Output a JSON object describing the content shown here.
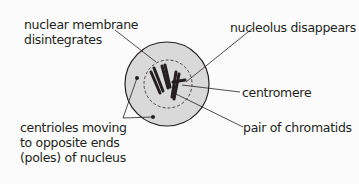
{
  "diagram": {
    "labels": {
      "nuclear_membrane_line1": "nuclear membrane",
      "nuclear_membrane_line2": "disintegrates",
      "nucleolus": "nucleolus disappears",
      "centromere": "centromere",
      "chromatids": "pair of chromatids",
      "centrioles_line1": "centrioles moving",
      "centrioles_line2": "to opposite ends",
      "centrioles_line3": "(poles) of nucleus"
    },
    "colors": {
      "cell_fill": "#d9d9d9",
      "outline": "#231f20",
      "background": "#fbfbfb"
    }
  }
}
